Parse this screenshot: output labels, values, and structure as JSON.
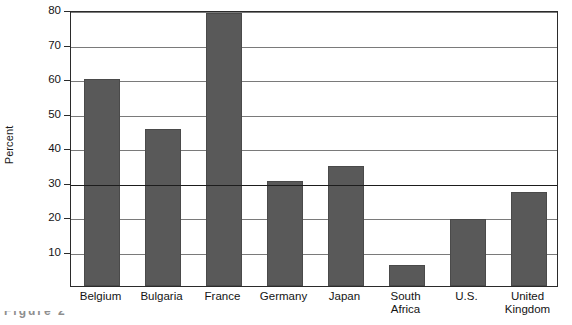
{
  "chart_data": {
    "type": "bar",
    "title": "",
    "xlabel": "",
    "ylabel": "Percent",
    "ylim": [
      0,
      80
    ],
    "ytick_values": [
      10,
      20,
      30,
      40,
      50,
      60,
      70,
      80
    ],
    "ytick_labels": [
      "10",
      "20",
      "30",
      "40",
      "50",
      "60",
      "70",
      "80"
    ],
    "grid": true,
    "grid_axis": "y",
    "emphasis_gridline": 30,
    "legend": null,
    "categories": [
      "Belgium",
      "Bulgaria",
      "France",
      "Germany",
      "Japan",
      "South Africa",
      "U.S.",
      "United Kingdom"
    ],
    "category_label_lines": [
      [
        "Belgium"
      ],
      [
        "Bulgaria"
      ],
      [
        "France"
      ],
      [
        "Germany"
      ],
      [
        "Japan"
      ],
      [
        "South",
        "Africa"
      ],
      [
        "U.S."
      ],
      [
        "United",
        "Kingdom"
      ]
    ],
    "values": [
      60,
      45.5,
      79,
      30.3,
      34.8,
      6.2,
      19.4,
      27.2
    ],
    "bar_color": "#595959",
    "axis_color": "#2b2b2b",
    "gridline_color": "#7a7a7a",
    "background_color": "#ffffff"
  },
  "y_axis": {
    "title": "Percent"
  },
  "caption": {
    "text": "Figure 2"
  }
}
